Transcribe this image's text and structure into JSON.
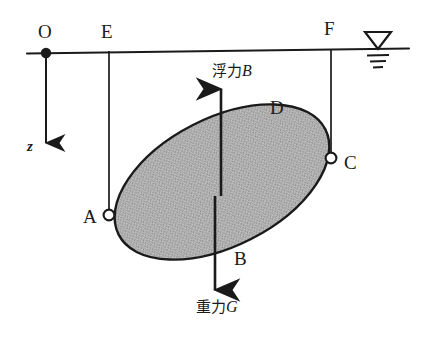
{
  "figure": {
    "caption_fragment": "",
    "points": {
      "origin": "O",
      "e": "E",
      "f": "F",
      "a": "A",
      "c": "C",
      "d": "D",
      "b": "B"
    },
    "axis": {
      "z_label": "z",
      "direction": "downward"
    },
    "forces": {
      "buoyancy_label": "浮力",
      "buoyancy_symbol": "B",
      "gravity_label": "重力",
      "gravity_symbol": "G"
    },
    "water_surface": {
      "symbol_name": "water-level-symbol",
      "tick_count": 3
    },
    "body": {
      "shape": "ellipse",
      "fill_color": "#a8a8a8",
      "stroke_color": "#1a1a1a",
      "rotation_deg": -27
    },
    "colors": {
      "ink": "#1a1a1a",
      "body_fill": "#a8a8a8",
      "background": "#ffffff"
    }
  }
}
